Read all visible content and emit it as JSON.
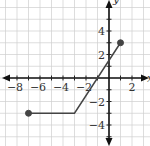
{
  "chart_data": {
    "type": "line",
    "title": "",
    "xlabel": "x",
    "ylabel": "y",
    "xlim": [
      -9,
      3
    ],
    "ylim": [
      -6,
      6
    ],
    "grid": true,
    "x_tick_labels": [
      "-8",
      "-6",
      "-4",
      "-2",
      "2"
    ],
    "y_tick_labels": [
      "4",
      "2",
      "-2",
      "-4"
    ],
    "series": [
      {
        "name": "piecewise",
        "points": [
          [
            -7,
            -3
          ],
          [
            -3,
            -3
          ],
          [
            1,
            3
          ]
        ],
        "endpoints": [
          {
            "x": -7,
            "y": -3,
            "style": "closed"
          },
          {
            "x": 1,
            "y": 3,
            "style": "closed"
          }
        ]
      }
    ],
    "colors": {
      "line": "#444444",
      "axes": "#111111",
      "grid": "#cfcfcf"
    }
  }
}
